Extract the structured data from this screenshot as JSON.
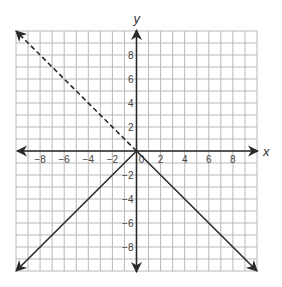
{
  "chart_data": {
    "type": "line",
    "title": "",
    "xlabel": "x",
    "ylabel": "y",
    "xlim": [
      -10,
      10
    ],
    "ylim": [
      -10,
      10
    ],
    "grid": true,
    "grid_step": 1,
    "x_ticks": [
      -8,
      -6,
      -4,
      -2,
      0,
      2,
      4,
      6,
      8
    ],
    "y_ticks": [
      8,
      6,
      4,
      2,
      -2,
      -4,
      -6,
      -8
    ],
    "x_tick_labels": [
      "−8",
      "−6",
      "−4",
      "−2",
      "0",
      "2",
      "4",
      "6",
      "8"
    ],
    "y_tick_labels": [
      "8",
      "6",
      "4",
      "2",
      "−2",
      "−4",
      "−6",
      "−8"
    ],
    "series": [
      {
        "name": "dashed ray y = -x (x ≤ 0)",
        "style": "dashed",
        "arrow_end": true,
        "points": [
          [
            0,
            0
          ],
          [
            -10,
            10
          ]
        ]
      },
      {
        "name": "solid ray y = x (x ≤ 0)",
        "style": "solid",
        "arrow_end": true,
        "points": [
          [
            0,
            0
          ],
          [
            -10,
            -10
          ]
        ]
      },
      {
        "name": "solid ray y = -x (x ≥ 0)",
        "style": "solid",
        "arrow_end": true,
        "points": [
          [
            0,
            0
          ],
          [
            10,
            -10
          ]
        ]
      }
    ],
    "colors": {
      "grid": "#b8b8b8",
      "axis": "#2a2a2a",
      "line": "#2a2a2a"
    }
  }
}
